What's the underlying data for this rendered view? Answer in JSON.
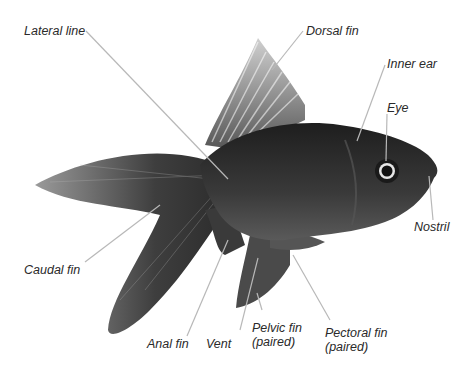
{
  "diagram": {
    "labels": {
      "lateral_line": "Lateral line",
      "dorsal_fin": "Dorsal fin",
      "inner_ear": "Inner ear",
      "eye": "Eye",
      "nostril": "Nostril",
      "caudal_fin": "Caudal fin",
      "anal_fin": "Anal fin",
      "vent": "Vent",
      "pelvic_fin_l1": "Pelvic fin",
      "pelvic_fin_l2": "(paired)",
      "pectoral_fin_l1": "Pectoral fin",
      "pectoral_fin_l2": "(paired)"
    },
    "colors": {
      "leader_line": "#b8b8b8",
      "label_text": "#2a2a2a",
      "fish_body": "#2e2e2e",
      "fin": "#4a4a4a",
      "background": "#ffffff"
    }
  }
}
